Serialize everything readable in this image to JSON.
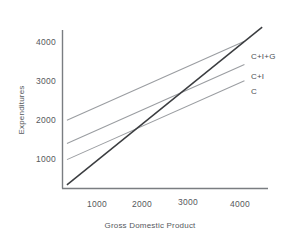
{
  "chart_data": {
    "type": "line",
    "title": "",
    "xlabel": "Gross Domestic Product",
    "ylabel": "Expenditures",
    "xlim": [
      0,
      4600
    ],
    "ylim": [
      0,
      4300
    ],
    "xticks": [
      "1000",
      "2000",
      "3000",
      "4000"
    ],
    "xtick_values": [
      1000,
      2000,
      3000,
      4000
    ],
    "yticks": [
      "1000",
      "2000",
      "3000",
      "4000"
    ],
    "ytick_values": [
      1000,
      2000,
      3000,
      4000
    ],
    "grid": false,
    "legend": "inline-right-end-labels",
    "series": [
      {
        "name": "C+I+G",
        "label": "C+I+G",
        "color": "#9a9da1",
        "intercept": 1850,
        "slope": 0.55,
        "x": [
          100,
          4100
        ],
        "values": [
          1905,
          4105
        ]
      },
      {
        "name": "C+I",
        "label": "C+I",
        "color": "#9a9da1",
        "intercept": 1200,
        "slope": 0.55,
        "x": [
          100,
          4100
        ],
        "values": [
          1255,
          3455
        ]
      },
      {
        "name": "C",
        "label": "C",
        "color": "#9a9da1",
        "intercept": 750,
        "slope": 0.55,
        "x": [
          100,
          4100
        ],
        "values": [
          805,
          3005
        ]
      },
      {
        "name": "45-degree-line",
        "label": "",
        "color": "#3b3d40",
        "intercept": 0,
        "slope": 1.0,
        "x": [
          100,
          4500
        ],
        "values": [
          100,
          4500
        ]
      }
    ]
  },
  "axes": {
    "x_title": "Gross Domestic Product",
    "y_title": "Expenditures",
    "x_tick_1": "1000",
    "x_tick_2": "2000",
    "x_tick_3": "3000",
    "x_tick_4": "4000",
    "y_tick_1": "1000",
    "y_tick_2": "2000",
    "y_tick_3": "3000",
    "y_tick_4": "4000"
  },
  "series_labels": {
    "cig": "C+I+G",
    "ci": "C+I",
    "c": "C"
  },
  "colors": {
    "axis": "#7a7d81",
    "series": "#9a9da1",
    "reference": "#3b3d40",
    "text": "#55585c",
    "background": "#ffffff"
  }
}
